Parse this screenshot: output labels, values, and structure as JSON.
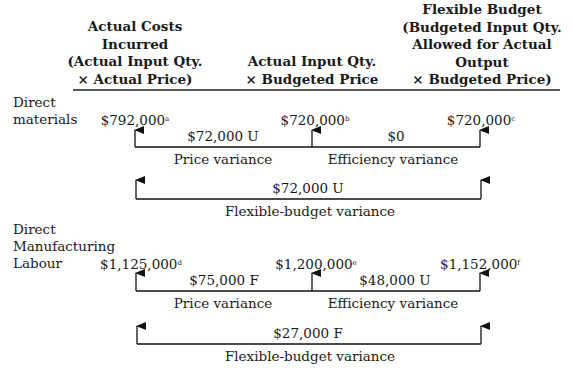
{
  "headers": {
    "col1": [
      "Actual Costs",
      "Incurred",
      "(Actual Input Qty.",
      "× Actual Price)"
    ],
    "col2": [
      "Actual Input Qty.",
      "× Budgeted Price"
    ],
    "col3": [
      "Flexible Budget",
      "(Budgeted Input Qty.",
      "Allowed for Actual",
      "Output",
      "× Budgeted Price)"
    ]
  },
  "direct_materials": {
    "label": [
      "Direct",
      "materials"
    ],
    "values": [
      {
        "amount": "$792,000",
        "note": "a"
      },
      {
        "amount": "$720,000",
        "note": "b"
      },
      {
        "amount": "$720,000",
        "note": "c"
      }
    ],
    "price_variance": {
      "amount": "$72,000 U",
      "label": "Price variance"
    },
    "efficiency_variance": {
      "amount": "$0",
      "label": "Efficiency variance"
    },
    "flexible_budget_variance": {
      "amount": "$72,000 U",
      "label": "Flexible-budget variance"
    }
  },
  "direct_labour": {
    "label": [
      "Direct",
      "Manufacturing",
      "Labour"
    ],
    "values": [
      {
        "amount": "$1,125,000",
        "note": "d"
      },
      {
        "amount": "$1,200,000",
        "note": "e"
      },
      {
        "amount": "$1,152,000",
        "note": "f"
      }
    ],
    "price_variance": {
      "amount": "$75,000 F",
      "label": "Price variance"
    },
    "efficiency_variance": {
      "amount": "$48,000 U",
      "label": "Efficiency variance"
    },
    "flexible_budget_variance": {
      "amount": "$27,000 F",
      "label": "Flexible-budget variance"
    }
  }
}
